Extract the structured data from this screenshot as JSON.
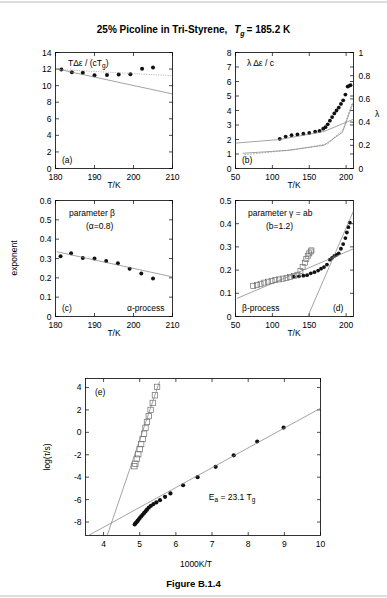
{
  "figure": {
    "title_main": "25% Picoline in Tri-Styrene,",
    "title_tg": "T",
    "title_tg_sub": "g",
    "title_tg_val": "= 185.2 K",
    "caption": "Figure B.1.4"
  },
  "chart_data": [
    {
      "type": "scatter",
      "panel": "a",
      "panel_label": "(a)",
      "title": "TΔε / (cTg)",
      "title_parts": {
        "lead": "TΔε / (cT",
        "sub": "g",
        "tail": ")"
      },
      "xlabel": "T/K",
      "ylabel": "",
      "xlim": [
        180,
        210
      ],
      "ylim": [
        0,
        14
      ],
      "xticks": [
        180,
        190,
        200,
        210
      ],
      "yticks": [
        0,
        2,
        4,
        6,
        8,
        10,
        12,
        14
      ],
      "grid": false,
      "series": [
        {
          "name": "TΔε/(cTg) data",
          "marker": "filled-circle",
          "x": [
            181.5,
            184.2,
            187.0,
            190.0,
            193.2,
            196.2,
            199.2,
            202.2,
            205.0
          ],
          "y": [
            11.95,
            11.62,
            11.55,
            11.25,
            11.28,
            11.33,
            11.36,
            12.05,
            12.18
          ]
        },
        {
          "name": "fit-solid",
          "type": "line",
          "x": [
            180.5,
            210.0
          ],
          "y": [
            12.0,
            9.0
          ]
        },
        {
          "name": "fit-dotted",
          "type": "line-dotted",
          "x": [
            180.5,
            210.0
          ],
          "y": [
            11.95,
            11.2
          ]
        }
      ]
    },
    {
      "type": "scatter",
      "panel": "b",
      "panel_label": "(b)",
      "title": "λ Δε / c",
      "xlabel": "T/K",
      "ylabel": "",
      "y2label": "λ",
      "xlim": [
        50,
        210
      ],
      "ylim": [
        0,
        8
      ],
      "y2lim": [
        0,
        1
      ],
      "xticks": [
        50,
        100,
        150,
        200
      ],
      "yticks": [
        0,
        1,
        2,
        3,
        4,
        5,
        6,
        7,
        8
      ],
      "y2ticks": [
        0,
        0.2,
        0.4,
        0.6,
        0.8,
        1
      ],
      "grid": false,
      "series": [
        {
          "name": "λΔε/c data",
          "marker": "filled-circle",
          "x": [
            110,
            118,
            126,
            134,
            142,
            150,
            158,
            164,
            169,
            172,
            175,
            178,
            181,
            184,
            187,
            190,
            193,
            196,
            199,
            202,
            204,
            206
          ],
          "y": [
            2.05,
            2.2,
            2.3,
            2.35,
            2.4,
            2.45,
            2.55,
            2.6,
            2.75,
            2.85,
            3.05,
            3.3,
            3.55,
            3.8,
            4.0,
            4.2,
            4.45,
            4.7,
            5.1,
            5.65,
            5.7,
            5.75
          ]
        },
        {
          "name": "fit-upper-solid",
          "type": "line",
          "x": [
            50,
            110,
            170,
            210
          ],
          "y": [
            1.75,
            2.0,
            2.55,
            3.4
          ]
        },
        {
          "name": "fit-lower-solid",
          "type": "line",
          "x": [
            60,
            120,
            170,
            195,
            210
          ],
          "y": [
            1.05,
            1.25,
            1.6,
            2.5,
            4.6
          ]
        },
        {
          "name": "fit-dashed",
          "type": "line-dashed",
          "x": [
            62,
            130,
            175,
            196,
            208
          ],
          "y": [
            0.95,
            1.3,
            1.7,
            2.7,
            4.5
          ]
        }
      ]
    },
    {
      "type": "scatter",
      "panel": "c",
      "panel_label": "(c)",
      "title": "parameter β",
      "subtitle": "(α=0.8)",
      "annotation": "α-process",
      "xlabel": "T/K",
      "ylabel": "exponent",
      "xlim": [
        180,
        210
      ],
      "ylim": [
        0,
        0.6
      ],
      "xticks": [
        180,
        190,
        200,
        210
      ],
      "yticks": [
        0,
        0.1,
        0.2,
        0.3,
        0.4,
        0.5,
        0.6
      ],
      "grid": false,
      "series": [
        {
          "name": "β exponent data",
          "marker": "filled-circle",
          "x": [
            181.3,
            184.0,
            187.0,
            190.0,
            193.0,
            196.0,
            199.0,
            202.0,
            205.0
          ],
          "y": [
            0.312,
            0.327,
            0.303,
            0.3,
            0.287,
            0.275,
            0.247,
            0.222,
            0.197
          ]
        },
        {
          "name": "fit-line",
          "type": "line",
          "x": [
            180.3,
            210.0
          ],
          "y": [
            0.335,
            0.205
          ]
        }
      ]
    },
    {
      "type": "scatter",
      "panel": "d",
      "panel_label": "(d)",
      "title": "parameter γ = ab",
      "subtitle": "(b=1.2)",
      "annotation": "β-process",
      "xlabel": "T/K",
      "ylabel": "",
      "xlim": [
        50,
        210
      ],
      "ylim": [
        0,
        0.5
      ],
      "xticks": [
        50,
        100,
        150,
        200
      ],
      "yticks": [
        0,
        0.1,
        0.2,
        0.3,
        0.4,
        0.5
      ],
      "grid": false,
      "series": [
        {
          "name": "γ filled data",
          "marker": "filled-circle",
          "x": [
            129,
            136,
            142,
            147,
            152,
            157,
            162,
            166,
            170,
            174,
            178,
            181,
            184,
            187,
            190,
            193,
            196,
            199,
            201,
            203,
            205
          ],
          "y": [
            0.172,
            0.173,
            0.176,
            0.178,
            0.186,
            0.191,
            0.198,
            0.206,
            0.213,
            0.224,
            0.245,
            0.253,
            0.261,
            0.266,
            0.272,
            0.292,
            0.312,
            0.338,
            0.362,
            0.385,
            0.405
          ]
        },
        {
          "name": "γ open-square data",
          "marker": "open-square",
          "x": [
            74,
            79,
            84,
            89,
            94,
            99,
            104,
            109,
            114,
            119,
            124,
            129,
            134,
            138,
            141,
            144,
            146,
            148,
            150,
            152,
            153
          ],
          "y": [
            0.131,
            0.136,
            0.141,
            0.146,
            0.15,
            0.153,
            0.157,
            0.16,
            0.163,
            0.166,
            0.17,
            0.174,
            0.18,
            0.196,
            0.213,
            0.232,
            0.248,
            0.262,
            0.272,
            0.28,
            0.285
          ]
        },
        {
          "name": "fit-shallow",
          "type": "line",
          "x": [
            52,
            210
          ],
          "y": [
            0.078,
            0.292
          ]
        },
        {
          "name": "fit-steep",
          "type": "line",
          "x": [
            148,
            210
          ],
          "y": [
            0.0,
            0.455
          ]
        }
      ]
    },
    {
      "type": "scatter",
      "panel": "e",
      "panel_label": "(e)",
      "title": "",
      "annotation": "Ea = 23.1 Tg",
      "annotation_parts": {
        "lead": "E",
        "sub1": "a",
        "mid": " = 23.1 T",
        "sub2": "g"
      },
      "xlabel": "1000K/T",
      "ylabel": "log(τ/s)",
      "xlim": [
        3.5,
        10
      ],
      "ylim": [
        -9.2,
        4.8
      ],
      "xticks": [
        4,
        5,
        6,
        7,
        8,
        9,
        10
      ],
      "yticks": [
        -8,
        -6,
        -4,
        -2,
        0,
        2,
        4
      ],
      "grid": false,
      "series": [
        {
          "name": "α-relaxation filled data",
          "marker": "filled-circle",
          "x": [
            4.86,
            4.88,
            4.91,
            4.94,
            4.97,
            5.0,
            5.04,
            5.08,
            5.12,
            5.16,
            5.2,
            5.25,
            5.31,
            5.38,
            5.46,
            5.56,
            5.7,
            5.85,
            6.2,
            6.6,
            7.1,
            7.6,
            8.25,
            8.98
          ],
          "y": [
            -8.22,
            -8.12,
            -8.02,
            -7.9,
            -7.78,
            -7.65,
            -7.5,
            -7.35,
            -7.2,
            -7.05,
            -6.9,
            -6.72,
            -6.55,
            -6.4,
            -6.25,
            -6.05,
            -5.75,
            -5.45,
            -4.72,
            -4.0,
            -3.08,
            -2.05,
            -0.82,
            0.42
          ]
        },
        {
          "name": "β-relaxation open-square data",
          "marker": "open-square",
          "x": [
            4.85,
            4.88,
            4.92,
            4.96,
            5.0,
            5.04,
            5.08,
            5.12,
            5.16,
            5.2,
            5.25,
            5.3,
            5.36,
            5.42,
            5.48
          ],
          "y": [
            -3.02,
            -2.8,
            -2.35,
            -1.95,
            -1.5,
            -1.05,
            -0.6,
            -0.12,
            0.4,
            0.92,
            1.45,
            2.0,
            2.62,
            3.3,
            4.05
          ]
        },
        {
          "name": "fit-arrhenius-alpha",
          "type": "line",
          "x": [
            3.58,
            10.0
          ],
          "y": [
            -9.2,
            2.15
          ]
        },
        {
          "name": "fit-arrhenius-beta",
          "type": "line",
          "x": [
            4.1,
            5.55
          ],
          "y": [
            -9.2,
            4.55
          ]
        }
      ]
    }
  ]
}
